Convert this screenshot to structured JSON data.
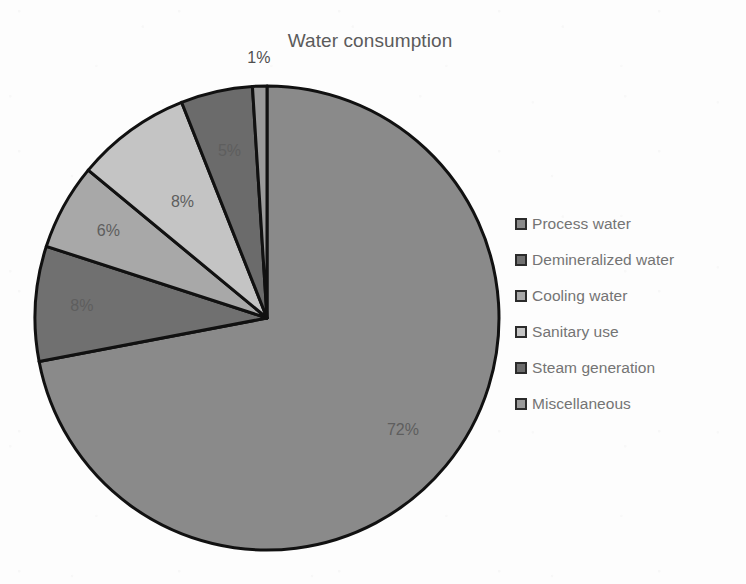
{
  "chart_data": {
    "type": "pie",
    "title": "Water consumption",
    "xlabel": "",
    "ylabel": "",
    "legend_position": "right",
    "grid": false,
    "unit": "%",
    "categories": [
      "Process water",
      "Demineralized water",
      "Cooling water",
      "Sanitary use",
      "Steam generation",
      "Miscellaneous"
    ],
    "values": [
      72,
      8,
      6,
      8,
      5,
      1
    ],
    "data_labels": [
      "72%",
      "8%",
      "6%",
      "8%",
      "5%",
      "1%"
    ],
    "colors": [
      "#8a8a8a",
      "#707070",
      "#a8a8a8",
      "#c4c4c4",
      "#6b6b6b",
      "#9a9a9a"
    ],
    "slices": [
      {
        "label": "Process water",
        "value": 72,
        "data_label": "72%",
        "color": "#8a8a8a"
      },
      {
        "label": "Demineralized water",
        "value": 8,
        "data_label": "8%",
        "color": "#707070"
      },
      {
        "label": "Cooling water",
        "value": 6,
        "data_label": "6%",
        "color": "#a8a8a8"
      },
      {
        "label": "Sanitary use",
        "value": 8,
        "data_label": "8%",
        "color": "#c4c4c4"
      },
      {
        "label": "Steam generation",
        "value": 5,
        "data_label": "5%",
        "color": "#6b6b6b"
      },
      {
        "label": "Miscellaneous",
        "value": 1,
        "data_label": "1%",
        "color": "#9a9a9a"
      }
    ]
  },
  "title": "Water consumption",
  "legend": {
    "items": [
      {
        "label": "Process water",
        "color": "#8a8a8a"
      },
      {
        "label": "Demineralized water",
        "color": "#707070"
      },
      {
        "label": "Cooling water",
        "color": "#a8a8a8"
      },
      {
        "label": "Sanitary use",
        "color": "#c4c4c4"
      },
      {
        "label": "Steam generation",
        "color": "#6b6b6b"
      },
      {
        "label": "Miscellaneous",
        "color": "#9a9a9a"
      }
    ]
  },
  "style": {
    "background": "#fdfdfd",
    "title_color": "#5b5b5b",
    "legend_text_color": "#747474",
    "slice_border_color": "#111111",
    "label_color": "#5e5e5e"
  }
}
